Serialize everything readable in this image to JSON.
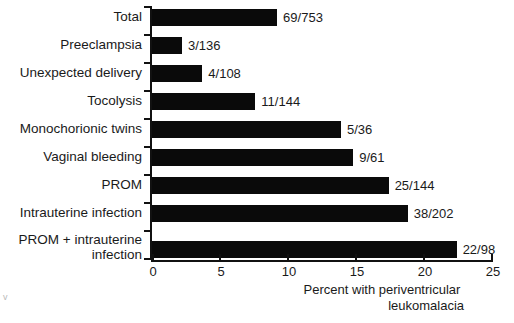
{
  "chart_data": {
    "type": "bar",
    "orientation": "horizontal",
    "title": "",
    "xlabel": "Percent with periventricular leukomalacia",
    "xlabel_line1": "Percent with periventricular",
    "xlabel_line2": "leukomalacia",
    "ylabel": "",
    "xlim": [
      0,
      25
    ],
    "xticks": [
      0,
      5,
      10,
      15,
      20,
      25
    ],
    "xtick_labels": [
      "0",
      "5",
      "10",
      "15",
      "20",
      "25"
    ],
    "grid": false,
    "legend": null,
    "bar_color": "#0a0a0a",
    "categories": [
      "Total",
      "Preeclampsia",
      "Unexpected delivery",
      "Tocolysis",
      "Monochorionic twins",
      "Vaginal bleeding",
      "PROM",
      "Intrauterine infection",
      "PROM + intrauterine\ninfection"
    ],
    "values": [
      9.2,
      2.2,
      3.7,
      7.6,
      13.9,
      14.8,
      17.4,
      18.8,
      22.4
    ],
    "data_labels": [
      "69/753",
      "3/136",
      "4/108",
      "11/144",
      "5/36",
      "9/61",
      "25/144",
      "38/202",
      "22/98"
    ],
    "numerators": [
      69,
      3,
      4,
      11,
      5,
      9,
      25,
      38,
      22
    ],
    "denominators": [
      753,
      136,
      108,
      144,
      36,
      61,
      144,
      202,
      98
    ]
  },
  "artifact": {
    "mark": "v"
  }
}
